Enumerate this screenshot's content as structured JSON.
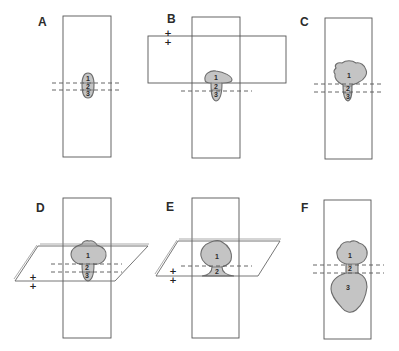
{
  "figure": {
    "panels": [
      {
        "id": "A",
        "label": "A",
        "regions": [
          "1",
          "2",
          "3"
        ],
        "markers": []
      },
      {
        "id": "B",
        "label": "B",
        "regions": [
          "1",
          "2",
          "3"
        ],
        "markers": [
          "+",
          "+"
        ]
      },
      {
        "id": "C",
        "label": "C",
        "regions": [
          "1",
          "2",
          "3"
        ],
        "markers": []
      },
      {
        "id": "D",
        "label": "D",
        "regions": [
          "1",
          "2",
          "3"
        ],
        "markers": [
          "+",
          "+"
        ]
      },
      {
        "id": "E",
        "label": "E",
        "regions": [
          "1",
          "2"
        ],
        "markers": [
          "+",
          "+"
        ]
      },
      {
        "id": "F",
        "label": "F",
        "regions": [
          "1",
          "2",
          "3"
        ],
        "markers": []
      }
    ],
    "colors": {
      "shape_fill": "#c4c4c4",
      "shape_stroke": "#6d6d6d",
      "line": "#555555"
    }
  }
}
